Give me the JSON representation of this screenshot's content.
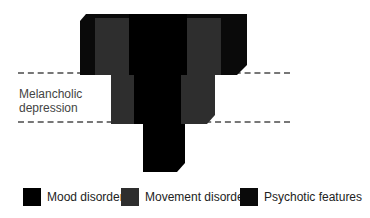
{
  "diagram": {
    "band_label": "Melancholic depression",
    "band_label_lines": [
      "Melancholic",
      "depression"
    ],
    "colors": {
      "mood_disorder": "#000000",
      "movement_disorder": "#2b2b2b",
      "psychotic_features": "#0a0a0a",
      "dashed_line": "#777777"
    },
    "legend": [
      {
        "label": "Mood disorder",
        "color": "#000000"
      },
      {
        "label": "Movement disorder",
        "color": "#2e2e2e"
      },
      {
        "label": "Psychotic features",
        "color": "#0a0a0a"
      }
    ]
  }
}
